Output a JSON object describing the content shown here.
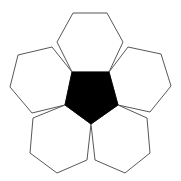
{
  "diagram": {
    "title": "",
    "colors": {
      "background": "#ffffff",
      "pentagon_fill": "#000000",
      "hexagon_fill": "#ffffff",
      "stroke": "#444444"
    },
    "pentagon": {
      "points": "72,72 109,72 118,105 91,124 65,105"
    },
    "hexagons": [
      {
        "name": "top",
        "points": "73,13 107,13 123,42 109,72 72,72 57,42"
      },
      {
        "name": "left",
        "points": "18,55 52,47 72,72 65,105 32,113 10,87"
      },
      {
        "name": "right",
        "points": "128,47 161,54 171,86 150,112 118,105 109,72"
      },
      {
        "name": "bottom-left",
        "points": "33,118 65,105 91,124 87,160 57,173 30,153"
      },
      {
        "name": "bottom-right",
        "points": "91,124 118,105 147,118 150,153 125,173 95,160"
      }
    ]
  }
}
